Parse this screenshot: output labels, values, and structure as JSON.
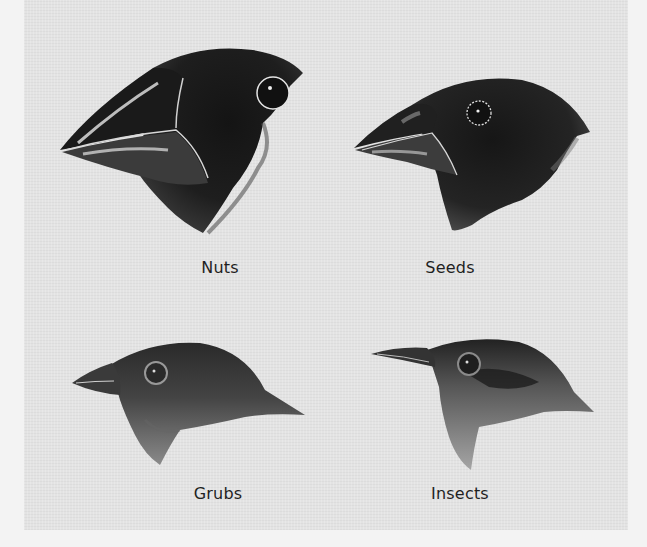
{
  "figure": {
    "background_color": "#e3e3e3",
    "border_color": "#f3f3f3",
    "panels": [
      {
        "label": "Nuts",
        "beak": "large crushing beak",
        "shading": "dark"
      },
      {
        "label": "Seeds",
        "beak": "medium crushing beak",
        "shading": "dark"
      },
      {
        "label": "Grubs",
        "beak": "small grasping beak",
        "shading": "medium"
      },
      {
        "label": "Insects",
        "beak": "thin probing beak",
        "shading": "light"
      }
    ]
  }
}
